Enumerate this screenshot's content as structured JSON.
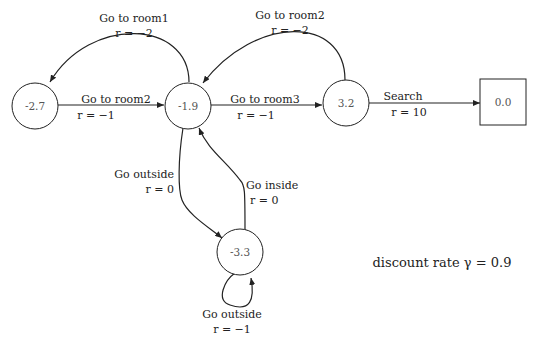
{
  "diagram": {
    "nodes": [
      {
        "id": "s1",
        "value": "-2.7",
        "shape": "circle"
      },
      {
        "id": "s2",
        "value": "-1.9",
        "shape": "circle"
      },
      {
        "id": "s3",
        "value": "3.2",
        "shape": "circle"
      },
      {
        "id": "s4",
        "value": "0.0",
        "shape": "square"
      },
      {
        "id": "s5",
        "value": "-3.3",
        "shape": "circle"
      }
    ],
    "edges": [
      {
        "from": "s1",
        "to": "s2",
        "action": "Go to room2",
        "reward": "r = −1"
      },
      {
        "from": "s2",
        "to": "s1",
        "action": "Go to room1",
        "reward": "r = −2"
      },
      {
        "from": "s2",
        "to": "s3",
        "action": "Go to room3",
        "reward": "r = −1"
      },
      {
        "from": "s3",
        "to": "s2",
        "action": "Go to room2",
        "reward": "r = −2"
      },
      {
        "from": "s3",
        "to": "s4",
        "action": "Search",
        "reward": "r = 10"
      },
      {
        "from": "s2",
        "to": "s5",
        "action": "Go outside",
        "reward": "r = 0"
      },
      {
        "from": "s5",
        "to": "s2",
        "action": "Go inside",
        "reward": "r = 0"
      },
      {
        "from": "s5",
        "to": "s5",
        "action": "Go outside",
        "reward": "r = −1"
      }
    ],
    "note": "discount rate γ = 0.9"
  }
}
